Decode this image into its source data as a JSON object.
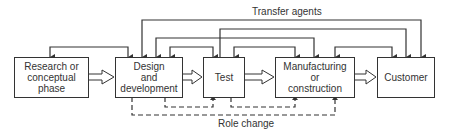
{
  "diagram": {
    "type": "flow",
    "nodes": [
      {
        "id": "research",
        "label_lines": [
          "Research or",
          "conceptual",
          "phase"
        ]
      },
      {
        "id": "design",
        "label_lines": [
          "Design",
          "and",
          "development"
        ]
      },
      {
        "id": "test",
        "label_lines": [
          "Test"
        ]
      },
      {
        "id": "manufacturing",
        "label_lines": [
          "Manufacturing",
          "or",
          "construction"
        ]
      },
      {
        "id": "customer",
        "label_lines": [
          "Customer"
        ]
      }
    ],
    "main_flow": [
      "research",
      "design",
      "test",
      "manufacturing",
      "customer"
    ],
    "labels": {
      "transfer_agents": "Transfer agents",
      "role_change": "Role change"
    },
    "transfer_agent_links": [
      {
        "from": "design",
        "to": "customer"
      },
      {
        "from": "test",
        "to": "customer"
      },
      {
        "from": "design",
        "to": "manufacturing"
      }
    ],
    "feedback_links": [
      {
        "between": [
          "research",
          "design"
        ]
      },
      {
        "between": [
          "design",
          "test"
        ]
      },
      {
        "between": [
          "test",
          "manufacturing"
        ]
      },
      {
        "between": [
          "manufacturing",
          "customer"
        ]
      }
    ],
    "role_change_links": [
      {
        "from": "design",
        "to": "test"
      },
      {
        "from": "test",
        "to": "manufacturing"
      },
      {
        "from": "design",
        "to": "manufacturing"
      }
    ],
    "colors": {
      "line": "#333333",
      "background": "#ffffff"
    }
  }
}
